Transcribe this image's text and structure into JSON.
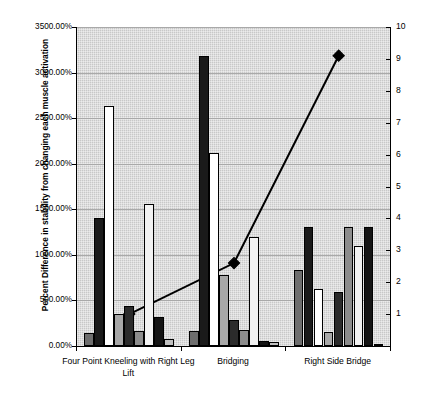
{
  "chart_data": {
    "type": "bar",
    "title": "",
    "xlabel": "",
    "ylabel": "Percent Difference in stability from changing each muscle activation",
    "ylabel_secondary": "",
    "categories": [
      "Four Point Kneeling with Right Leg Lift",
      "Bridging",
      "Right Side Bridge"
    ],
    "ylim": [
      0,
      3500
    ],
    "ytick_labels": [
      "0.00%",
      "500.00%",
      "1000.00%",
      "1500.00%",
      "2000.00%",
      "2500.00%",
      "3000.00%",
      "3500.00%"
    ],
    "ytick_values": [
      0,
      500,
      1000,
      1500,
      2000,
      2500,
      3000,
      3500
    ],
    "ylim_secondary": [
      0,
      10
    ],
    "ytick_labels_secondary": [
      "1",
      "2",
      "3",
      "4",
      "5",
      "6",
      "7",
      "8",
      "9",
      "10"
    ],
    "ytick_values_secondary": [
      1,
      2,
      3,
      4,
      5,
      6,
      7,
      8,
      9,
      10
    ],
    "grid": true,
    "legend": "none",
    "series": [
      {
        "name": "Series 1",
        "color": "#6e6e6e",
        "values": [
          140,
          160,
          830
        ]
      },
      {
        "name": "Series 2",
        "color": "#1a1a1a",
        "values": [
          1400,
          3180,
          1305
        ]
      },
      {
        "name": "Series 3",
        "color": "#ffffff",
        "values": [
          2635,
          2120,
          630
        ]
      },
      {
        "name": "Series 4",
        "color": "#a8a8a8",
        "values": [
          350,
          775,
          150
        ]
      },
      {
        "name": "Series 5",
        "color": "#2b2b2b",
        "values": [
          440,
          285,
          590
        ]
      },
      {
        "name": "Series 6",
        "color": "#8c8c8c",
        "values": [
          165,
          175,
          1310
        ]
      },
      {
        "name": "Series 7",
        "color": "#f2f2f2",
        "values": [
          1555,
          1200,
          1100
        ]
      },
      {
        "name": "Series 8",
        "color": "#141414",
        "values": [
          315,
          60,
          1305
        ]
      },
      {
        "name": "Series 9",
        "color": "#c0c0c0",
        "values": [
          75,
          40,
          25
        ]
      }
    ],
    "line_series": {
      "name": "Stability Index",
      "axis": "secondary",
      "color": "#000000",
      "marker": "diamond",
      "values": [
        1.0,
        2.6,
        9.1
      ]
    }
  }
}
